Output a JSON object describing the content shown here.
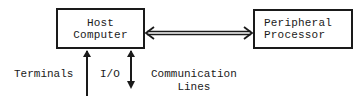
{
  "diagram": {
    "nodes": {
      "host": {
        "line1": "Host",
        "line2": "Computer"
      },
      "peripheral": {
        "line1": "Peripheral",
        "line2": "Processor"
      }
    },
    "labels": {
      "terminals": "Terminals",
      "io": "I/O",
      "communication_line1": "Communication",
      "communication_line2": "Lines"
    },
    "edges": [
      {
        "from": "host",
        "to": "peripheral",
        "style": "double-line",
        "direction": "bidirectional"
      },
      {
        "from": "terminals",
        "to": "host",
        "style": "single-line",
        "direction": "up"
      },
      {
        "from": "host",
        "to": "communication-lines",
        "label": "I/O",
        "style": "single-line",
        "direction": "bidirectional"
      }
    ],
    "colors": {
      "stroke": "#1a1a1a",
      "background": "#ffffff"
    }
  }
}
